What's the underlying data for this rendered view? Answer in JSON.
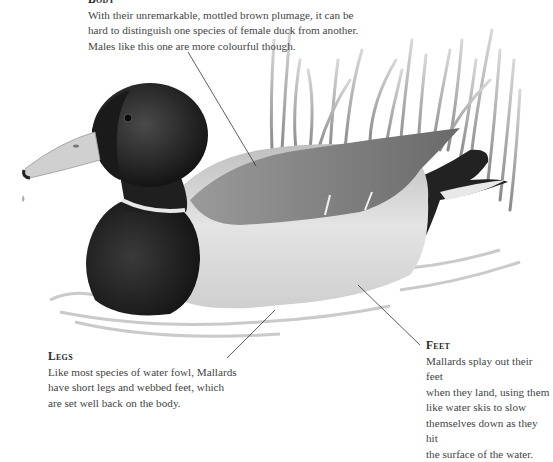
{
  "captions": {
    "body": {
      "heading": "Body",
      "text_lines": [
        "With their unremarkable, mottled brown plumage, it can be",
        "hard to distinguish one species of female duck from another.",
        "Males like this one are more colourful though."
      ]
    },
    "legs": {
      "heading": "Legs",
      "text_lines": [
        "Like most species of water fowl, Mallards",
        "have short legs and webbed feet, which",
        "are set well back on the body."
      ]
    },
    "feet": {
      "heading": "Feet",
      "text_lines": [
        "Mallards splay out their feet",
        "when they land, using them",
        "like water skis to slow",
        "themselves down as they hit",
        "the surface of the water."
      ]
    }
  },
  "illustration": {
    "subject": "Mallard duck (male) swimming among reeds",
    "colors": {
      "head": "#1e1e1e",
      "collar": "#e6e6e6",
      "breast": "#2b2b2b",
      "flank": "#d9d9d9",
      "wing": "#8a8a8a",
      "bill": "#cfcfcf",
      "reeds": "#a8a8a8",
      "water": "#c8c8c8",
      "leader_line": "#333333"
    }
  }
}
